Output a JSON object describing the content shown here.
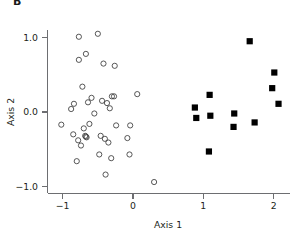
{
  "panel": {
    "label": "B"
  },
  "chart_data": {
    "type": "scatter",
    "title": "B",
    "xlabel": "Axis 1",
    "ylabel": "Axis 2",
    "xlim": [
      -1.25,
      2.25
    ],
    "ylim": [
      -1.15,
      1.2
    ],
    "xticks": [
      -1,
      0,
      1,
      2
    ],
    "xtick_labels": [
      "−1",
      "0",
      "1",
      "2"
    ],
    "yticks": [
      -1.0,
      0.0,
      1.0
    ],
    "ytick_labels": [
      "−1.0",
      "0.0",
      "1.0"
    ],
    "grid": false,
    "legend": "none",
    "series": [
      {
        "name": "open-circles",
        "marker": "open-circle",
        "color": "#3a3a3a",
        "points": [
          [
            -0.77,
            1.01
          ],
          [
            -0.5,
            1.05
          ],
          [
            -0.67,
            0.78
          ],
          [
            -0.77,
            0.7
          ],
          [
            -0.42,
            0.65
          ],
          [
            -0.26,
            0.62
          ],
          [
            -0.72,
            0.34
          ],
          [
            -0.59,
            0.19
          ],
          [
            -0.44,
            0.15
          ],
          [
            -0.3,
            0.21
          ],
          [
            -0.27,
            0.21
          ],
          [
            0.06,
            0.24
          ],
          [
            -0.84,
            0.11
          ],
          [
            -0.64,
            0.13
          ],
          [
            -0.88,
            0.04
          ],
          [
            -0.37,
            0.12
          ],
          [
            -0.33,
            0.05
          ],
          [
            -0.55,
            -0.02
          ],
          [
            -1.02,
            -0.17
          ],
          [
            -0.62,
            -0.16
          ],
          [
            -0.7,
            -0.22
          ],
          [
            -0.24,
            -0.18
          ],
          [
            -0.04,
            -0.18
          ],
          [
            -0.85,
            -0.3
          ],
          [
            -0.68,
            -0.32
          ],
          [
            -0.67,
            -0.33
          ],
          [
            -0.66,
            -0.34
          ],
          [
            -0.78,
            -0.38
          ],
          [
            -0.46,
            -0.32
          ],
          [
            -0.4,
            -0.36
          ],
          [
            -0.08,
            -0.35
          ],
          [
            -0.74,
            -0.45
          ],
          [
            -0.35,
            -0.41
          ],
          [
            -0.8,
            -0.66
          ],
          [
            -0.48,
            -0.57
          ],
          [
            -0.31,
            -0.62
          ],
          [
            -0.05,
            -0.57
          ],
          [
            -0.39,
            -0.84
          ],
          [
            0.3,
            -0.94
          ]
        ]
      },
      {
        "name": "filled-squares",
        "marker": "filled-square",
        "color": "#000000",
        "points": [
          [
            1.66,
            0.95
          ],
          [
            2.01,
            0.53
          ],
          [
            1.98,
            0.32
          ],
          [
            1.09,
            0.23
          ],
          [
            2.07,
            0.11
          ],
          [
            0.88,
            0.06
          ],
          [
            1.44,
            -0.02
          ],
          [
            1.1,
            -0.05
          ],
          [
            0.9,
            -0.08
          ],
          [
            1.73,
            -0.14
          ],
          [
            1.43,
            -0.2
          ],
          [
            1.08,
            -0.53
          ]
        ]
      }
    ]
  }
}
